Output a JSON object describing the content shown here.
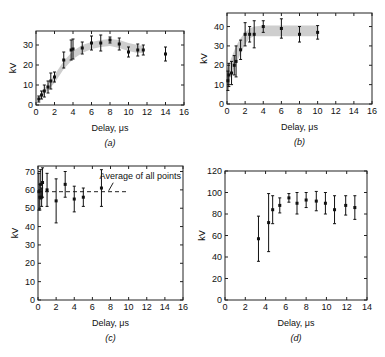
{
  "chart_data": [
    {
      "id": "a",
      "type": "scatter",
      "panel_label": "(a)",
      "xlabel": "Delay, μs",
      "ylabel": "kV",
      "xlim": [
        0,
        16
      ],
      "ylim": [
        0,
        37
      ],
      "xticks": [
        0,
        2,
        4,
        6,
        8,
        10,
        12,
        14,
        16
      ],
      "yticks": [
        0,
        10,
        20,
        30
      ],
      "frame": {
        "x": 36,
        "y": 31,
        "w": 148,
        "h": 74
      },
      "band": {
        "x": [
          0.3,
          1,
          2,
          3,
          4,
          5,
          6,
          7,
          8,
          9,
          10,
          11,
          11.6
        ],
        "lower": [
          2,
          6,
          11,
          18,
          23,
          26,
          28,
          29,
          29.5,
          28.5,
          27,
          26,
          26
        ],
        "upper": [
          4,
          9,
          15,
          22,
          27,
          30,
          31.5,
          32.5,
          33,
          32.5,
          31,
          30,
          29.5
        ]
      },
      "points": [
        {
          "x": 0.3,
          "y": 3,
          "err": 1.5
        },
        {
          "x": 0.6,
          "y": 5,
          "err": 2
        },
        {
          "x": 0.9,
          "y": 7,
          "err": 3
        },
        {
          "x": 1.3,
          "y": 9,
          "err": 3
        },
        {
          "x": 1.6,
          "y": 12,
          "err": 4
        },
        {
          "x": 2.0,
          "y": 14,
          "err": 2.5
        },
        {
          "x": 3.0,
          "y": 22.5,
          "err": 4
        },
        {
          "x": 3.8,
          "y": 27.5,
          "err": 5
        },
        {
          "x": 4.0,
          "y": 28,
          "err": 5
        },
        {
          "x": 5.0,
          "y": 28.5,
          "err": 3
        },
        {
          "x": 6.0,
          "y": 31,
          "err": 3.5
        },
        {
          "x": 7.0,
          "y": 31,
          "err": 4
        },
        {
          "x": 8.0,
          "y": 32.5,
          "err": 1.5
        },
        {
          "x": 9.0,
          "y": 30.5,
          "err": 3
        },
        {
          "x": 10.0,
          "y": 26.5,
          "err": 2.5
        },
        {
          "x": 11.0,
          "y": 27.5,
          "err": 3
        },
        {
          "x": 11.6,
          "y": 27.5,
          "err": 2.5
        },
        {
          "x": 14.0,
          "y": 25.5,
          "err": 3.5
        }
      ]
    },
    {
      "id": "b",
      "type": "scatter",
      "panel_label": "(b)",
      "xlabel": "Delay, μs",
      "ylabel": "kV",
      "xlim": [
        0,
        16
      ],
      "ylim": [
        0,
        47
      ],
      "xticks": [
        0,
        2,
        4,
        6,
        8,
        10,
        12,
        14,
        16
      ],
      "yticks": [
        0,
        10,
        20,
        30,
        40
      ],
      "frame": {
        "x": 227,
        "y": 13,
        "w": 145,
        "h": 91
      },
      "band": {
        "x": [
          0,
          0.5,
          1,
          1.5,
          2,
          2.5,
          3,
          4,
          6,
          8,
          10
        ],
        "lower": [
          10,
          15,
          21,
          26,
          31,
          34,
          35,
          35,
          35,
          35,
          35
        ],
        "upper": [
          18,
          24,
          30,
          34,
          37,
          39,
          40,
          40.5,
          40.5,
          40.5,
          40.5
        ]
      },
      "points": [
        {
          "x": 0.1,
          "y": 12,
          "err": 5
        },
        {
          "x": 0.2,
          "y": 15,
          "err": 6
        },
        {
          "x": 0.5,
          "y": 16,
          "err": 6
        },
        {
          "x": 0.8,
          "y": 20,
          "err": 5
        },
        {
          "x": 1.0,
          "y": 22,
          "err": 8
        },
        {
          "x": 1.5,
          "y": 28,
          "err": 5
        },
        {
          "x": 2.0,
          "y": 36,
          "err": 6
        },
        {
          "x": 2.5,
          "y": 36,
          "err": 4
        },
        {
          "x": 3.0,
          "y": 36,
          "err": 7
        },
        {
          "x": 4.0,
          "y": 40,
          "err": 3
        },
        {
          "x": 6.0,
          "y": 39,
          "err": 5
        },
        {
          "x": 8.0,
          "y": 36,
          "err": 4
        },
        {
          "x": 10.0,
          "y": 37,
          "err": 3.5
        }
      ]
    },
    {
      "id": "c",
      "type": "scatter",
      "panel_label": "(c)",
      "xlabel": "Delay, μs",
      "ylabel": "kV",
      "xlim": [
        0,
        16
      ],
      "ylim": [
        0,
        73
      ],
      "xticks": [
        0,
        2,
        4,
        6,
        8,
        10,
        12,
        14,
        16
      ],
      "yticks": [
        0,
        10,
        20,
        30,
        40,
        50,
        60,
        70
      ],
      "frame": {
        "x": 38,
        "y": 166,
        "w": 145,
        "h": 134
      },
      "reference_line": {
        "y": 59,
        "x_from": 0,
        "x_to": 10,
        "style": "dashed",
        "label": "Average of all points"
      },
      "points": [
        {
          "x": 0.1,
          "y": 59,
          "err": 10
        },
        {
          "x": 0.2,
          "y": 56,
          "err": 7
        },
        {
          "x": 0.3,
          "y": 63,
          "err": 8
        },
        {
          "x": 0.4,
          "y": 56,
          "err": 5
        },
        {
          "x": 0.5,
          "y": 64,
          "err": 8
        },
        {
          "x": 1.0,
          "y": 60,
          "err": 9
        },
        {
          "x": 2.0,
          "y": 54,
          "err": 12
        },
        {
          "x": 3.0,
          "y": 63,
          "err": 7
        },
        {
          "x": 4.0,
          "y": 55,
          "err": 7
        },
        {
          "x": 5.0,
          "y": 56,
          "err": 5
        },
        {
          "x": 7.0,
          "y": 61,
          "err": 10
        }
      ]
    },
    {
      "id": "d",
      "type": "scatter",
      "panel_label": "(d)",
      "xlabel": "Delay, μs",
      "ylabel": "kV",
      "xlim": [
        0,
        14
      ],
      "ylim": [
        0,
        120
      ],
      "xticks": [
        0,
        2,
        4,
        6,
        8,
        10,
        12,
        14
      ],
      "yticks": [
        0,
        20,
        40,
        60,
        80,
        100,
        120
      ],
      "frame": {
        "x": 225,
        "y": 171,
        "w": 142,
        "h": 129
      },
      "points": [
        {
          "x": 3.3,
          "y": 57,
          "err": 21
        },
        {
          "x": 4.3,
          "y": 72,
          "err": 27
        },
        {
          "x": 4.7,
          "y": 84,
          "err": 13
        },
        {
          "x": 5.4,
          "y": 88,
          "err": 7
        },
        {
          "x": 6.3,
          "y": 95,
          "err": 4
        },
        {
          "x": 7.1,
          "y": 90,
          "err": 10
        },
        {
          "x": 8.0,
          "y": 93,
          "err": 7
        },
        {
          "x": 9.0,
          "y": 92,
          "err": 9
        },
        {
          "x": 9.9,
          "y": 90,
          "err": 10
        },
        {
          "x": 10.8,
          "y": 84,
          "err": 13
        },
        {
          "x": 11.9,
          "y": 88,
          "err": 9
        },
        {
          "x": 12.8,
          "y": 86,
          "err": 11
        }
      ]
    }
  ]
}
